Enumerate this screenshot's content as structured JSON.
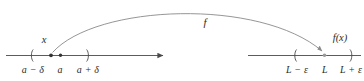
{
  "figure": {
    "colors": {
      "line": "#4a4a4a",
      "text": "#2b2b2b",
      "curve": "#8a8a8a",
      "dot": "#333333"
    }
  },
  "domain_axis": {
    "name": "domain-number-line",
    "point_label": "x",
    "ticks": [
      {
        "id": "a-minus-delta",
        "label": "a − δ",
        "x": 33
      },
      {
        "id": "a",
        "label": "a",
        "x": 60
      },
      {
        "id": "a-plus-delta",
        "label": "a + δ",
        "x": 88
      }
    ]
  },
  "range_axis": {
    "name": "range-number-line",
    "point_label": "f(x)",
    "ticks": [
      {
        "id": "L-minus-epsilon",
        "label": "L − ε",
        "x": 297
      },
      {
        "id": "L",
        "label": "L",
        "x": 325
      },
      {
        "id": "L-plus-epsilon",
        "label": "L + ε",
        "x": 351
      }
    ]
  },
  "mapping_arrow": {
    "name": "function-mapping-arrow",
    "label": "f"
  }
}
